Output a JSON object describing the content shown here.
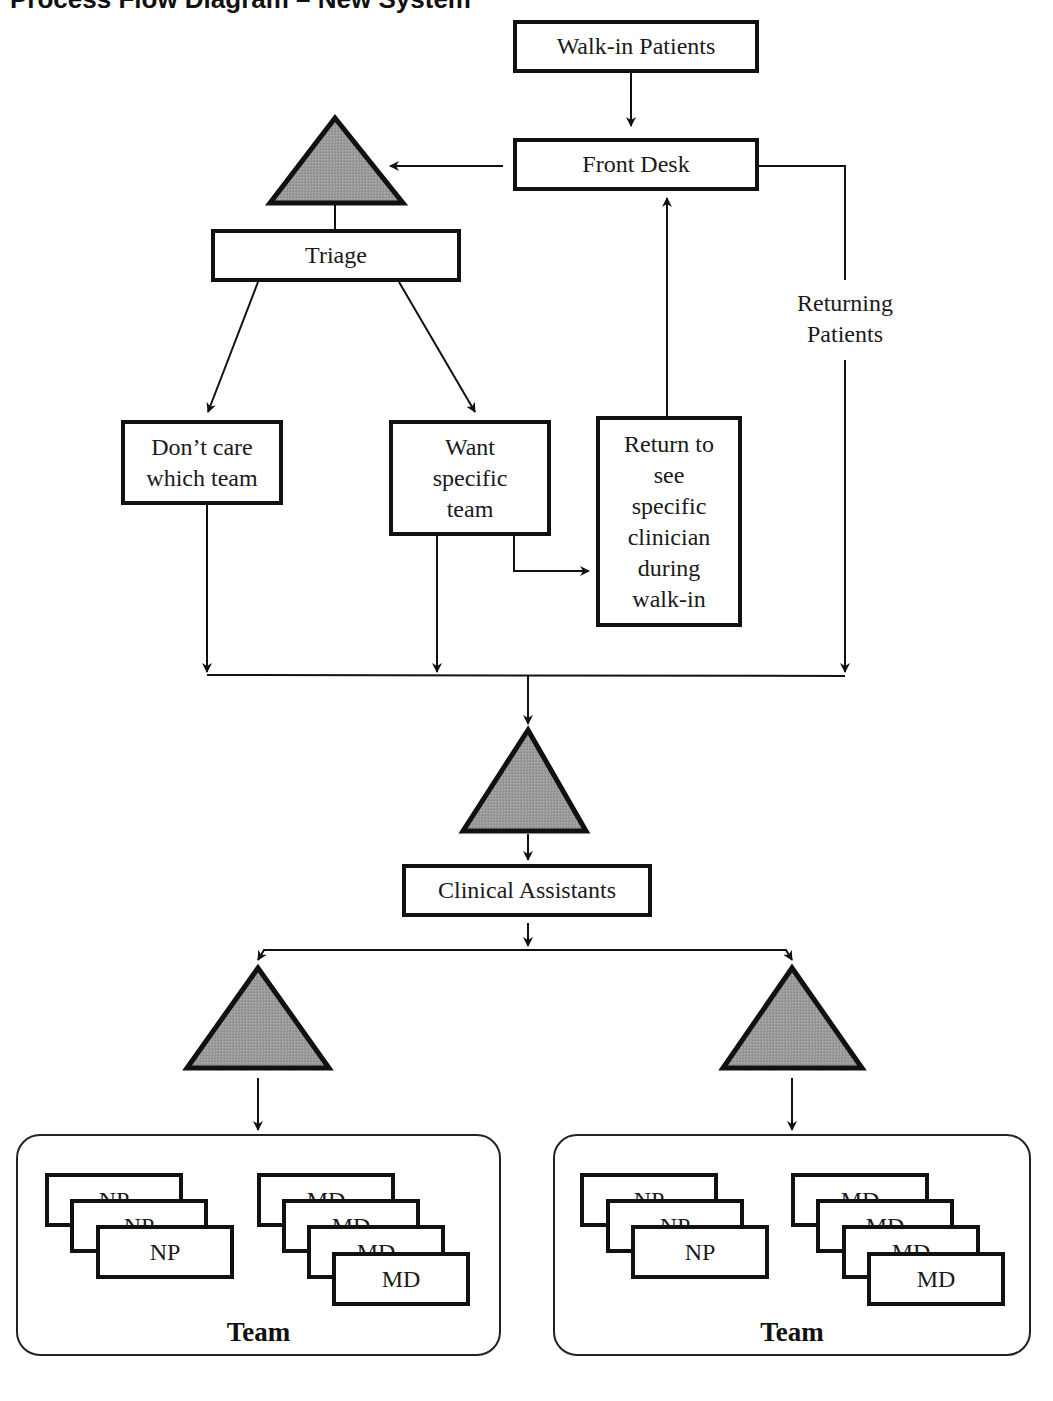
{
  "title": "Process Flow Diagram – New System",
  "colors": {
    "stroke": "#111111",
    "triangle_fill": "#9a9a9a",
    "background": "#ffffff"
  },
  "nodes": {
    "walk_in": "Walk-in Patients",
    "front_desk": "Front Desk",
    "triage": "Triage",
    "dont_care": "Don’t care\nwhich team",
    "want_specific": "Want\nspecific\nteam",
    "return_specific": "Return to\nsee\nspecific\nclinician\nduring\nwalk-in",
    "returning_patients": "Returning\nPatients",
    "clinical_assistants": "Clinical Assistants"
  },
  "queues": [
    {
      "id": "queue-before-triage",
      "symbol": "triangle"
    },
    {
      "id": "queue-before-clinical-assistants",
      "symbol": "triangle"
    },
    {
      "id": "queue-left-team",
      "symbol": "triangle"
    },
    {
      "id": "queue-right-team",
      "symbol": "triangle"
    }
  ],
  "teams": [
    {
      "label": "Team",
      "np_cards": [
        "NP",
        "NP",
        "NP"
      ],
      "md_cards": [
        "MD",
        "MD",
        "MD",
        "MD"
      ]
    },
    {
      "label": "Team",
      "np_cards": [
        "NP",
        "NP",
        "NP"
      ],
      "md_cards": [
        "MD",
        "MD",
        "MD",
        "MD"
      ]
    }
  ],
  "edges": [
    {
      "from": "Walk-in Patients",
      "to": "Front Desk"
    },
    {
      "from": "Front Desk",
      "to": "queue-before-triage"
    },
    {
      "from": "queue-before-triage",
      "to": "Triage"
    },
    {
      "from": "Triage",
      "to": "Don’t care which team"
    },
    {
      "from": "Triage",
      "to": "Want specific team"
    },
    {
      "from": "Want specific team",
      "to": "Return to see specific clinician during walk-in"
    },
    {
      "from": "Return to see specific clinician during walk-in",
      "to": "Front Desk"
    },
    {
      "from": "Front Desk",
      "to": "merge",
      "label": "Returning Patients"
    },
    {
      "from": "Don’t care which team",
      "to": "merge"
    },
    {
      "from": "Want specific team",
      "to": "merge"
    },
    {
      "from": "merge",
      "to": "queue-before-clinical-assistants"
    },
    {
      "from": "queue-before-clinical-assistants",
      "to": "Clinical Assistants"
    },
    {
      "from": "Clinical Assistants",
      "to": "queue-left-team"
    },
    {
      "from": "Clinical Assistants",
      "to": "queue-right-team"
    },
    {
      "from": "queue-left-team",
      "to": "Team (left)"
    },
    {
      "from": "queue-right-team",
      "to": "Team (right)"
    }
  ]
}
